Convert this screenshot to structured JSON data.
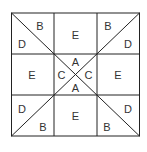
{
  "diagram": {
    "type": "quilt-block",
    "line_color": "#222222",
    "labels": {
      "top_left_b": "B",
      "top_left_d": "D",
      "top_center_e": "E",
      "top_right_b": "B",
      "top_right_d": "D",
      "middle_left_e": "E",
      "center_top_a": "A",
      "center_left_c": "C",
      "center_right_c": "C",
      "center_bottom_a": "A",
      "middle_right_e": "E",
      "bottom_left_d": "D",
      "bottom_left_b": "B",
      "bottom_center_e": "E",
      "bottom_right_d": "D",
      "bottom_right_b": "B"
    }
  }
}
